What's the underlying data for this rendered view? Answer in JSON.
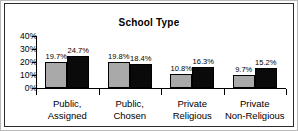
{
  "chart_data": {
    "type": "bar",
    "title": "School Type",
    "xlabel": "",
    "ylabel": "",
    "ylim": [
      0,
      40
    ],
    "grid": false,
    "legend": "none",
    "categories": [
      "Public,\nAssigned",
      "Public,\nChosen",
      "Private\nReligious",
      "Private\nNon-Religious"
    ],
    "category_lines": [
      [
        "Public,",
        "Assigned"
      ],
      [
        "Public,",
        "Chosen"
      ],
      [
        "Private",
        "Religious"
      ],
      [
        "Private",
        "Non-Religious"
      ]
    ],
    "series": [
      {
        "name": "light-gray-series",
        "color": "#a9a9a9",
        "values": [
          19.7,
          19.8,
          10.8,
          9.7
        ],
        "labels": [
          "19.7%",
          "19.8%",
          "10.8%",
          "9.7%"
        ]
      },
      {
        "name": "black-series",
        "color": "#0a0a0a",
        "values": [
          24.7,
          18.4,
          16.3,
          15.2
        ],
        "labels": [
          "24.7%",
          "18.4%",
          "16.3%",
          "15.2%"
        ]
      }
    ],
    "yticks": [
      0,
      10,
      20,
      30,
      40
    ],
    "ytick_labels": [
      "0%",
      "10%",
      "20%",
      "30%",
      "40%"
    ]
  },
  "colors": {
    "series_light": "#a9a9a9",
    "series_dark": "#0a0a0a",
    "axis": "#000000",
    "frame": "#2b2b2b",
    "background": "#ffffff"
  }
}
